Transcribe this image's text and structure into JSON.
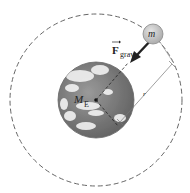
{
  "diagram": {
    "labels": {
      "satellite_mass": "m",
      "force_symbol": "F",
      "force_subscript": "grav",
      "earth_mass": "M",
      "earth_mass_subscript": "E",
      "radius": "r"
    },
    "colors": {
      "orbit": "#666666",
      "earth_base": "#7a7a7a",
      "satellite_fill": "#c8c8c8",
      "arrow": "#222222"
    }
  }
}
